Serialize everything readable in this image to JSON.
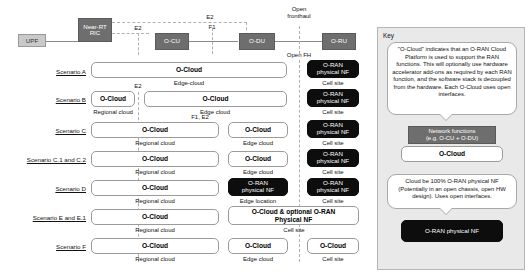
{
  "architecture": {
    "nodes": {
      "upf": "UPF",
      "near_rt_ric": "Near-RT\nRIC",
      "ocu": "O-CU",
      "odu": "O-DU",
      "dru": "O-RU"
    },
    "interfaces": {
      "e2_upper": "E2",
      "e2_lower": "E2",
      "f1": "F1",
      "open_fronthaul": "Open\nfronthaul",
      "open_fh": "Open FH"
    }
  },
  "columns": {
    "regional": "Regional cloud",
    "edge_cloud": "Edge cloud",
    "edge_cloud_hyphen": "Edge-cloud",
    "edge_location": "Edge location",
    "cell_site": "Cell site"
  },
  "common": {
    "ocloud": "O-Cloud",
    "oran_physical_nf": "O-RAN\nphysical NF",
    "ocloud_optional_nf": "O-Cloud & optional O-RAN\nPhysical NF",
    "f1_e2": "F1, E2",
    "e2": "E2"
  },
  "scenarios": [
    {
      "label": "Scenario A",
      "boxes": [
        {
          "kind": "ocloud",
          "text": "O-Cloud",
          "caption": "Edge-cloud"
        },
        {
          "kind": "blacknf",
          "text": "O-RAN\nphysical NF",
          "caption": "Cell site"
        }
      ]
    },
    {
      "label": "Scenario B",
      "boxes": [
        {
          "kind": "ocloud",
          "text": "O-Cloud",
          "caption": "Regional cloud"
        },
        {
          "kind": "ocloud",
          "text": "O-Cloud",
          "caption": "Edge cloud"
        },
        {
          "kind": "blacknf",
          "text": "O-RAN\nphysical NF",
          "caption": "Cell site"
        }
      ]
    },
    {
      "label": "Scenario C",
      "boxes": [
        {
          "kind": "ocloud",
          "text": "O-Cloud",
          "caption": "Regional cloud"
        },
        {
          "kind": "ocloud",
          "text": "O-Cloud",
          "caption": "Edge cloud"
        },
        {
          "kind": "blacknf",
          "text": "O-RAN\nphysical NF",
          "caption": "Cell site"
        }
      ]
    },
    {
      "label": "Scenario C.1 and C.2",
      "boxes": [
        {
          "kind": "ocloud",
          "text": "O-Cloud",
          "caption": "Regional cloud"
        },
        {
          "kind": "ocloud",
          "text": "O-Cloud",
          "caption": "Edge cloud"
        },
        {
          "kind": "blacknf",
          "text": "O-RAN\nphysical NF",
          "caption": "Cell site"
        }
      ]
    },
    {
      "label": "Scenario D",
      "boxes": [
        {
          "kind": "ocloud",
          "text": "O-Cloud",
          "caption": "Regional cloud"
        },
        {
          "kind": "blacknf",
          "text": "O-RAN\nphysical NF",
          "caption": "Edge location"
        },
        {
          "kind": "blacknf",
          "text": "O-RAN\nphysical NF",
          "caption": "Cell site"
        }
      ]
    },
    {
      "label": "Scenario E and E.1",
      "boxes": [
        {
          "kind": "ocloud",
          "text": "O-Cloud",
          "caption": "Regional cloud"
        },
        {
          "kind": "ocloud",
          "text": "O-Cloud & optional O-RAN\nPhysical NF",
          "caption": "Cell site"
        }
      ]
    },
    {
      "label": "Scenario F",
      "boxes": [
        {
          "kind": "ocloud",
          "text": "O-Cloud",
          "caption": "Regional cloud"
        },
        {
          "kind": "ocloud",
          "text": "O-Cloud",
          "caption": "Edge cloud"
        },
        {
          "kind": "ocloud",
          "text": "O-Cloud",
          "caption": "Cell site"
        }
      ]
    }
  ],
  "key": {
    "title": "Key",
    "bubble1": "\"O-Cloud\" indicates that an O-RAN Cloud Platform is used to support the RAN functions. This will optionally use hardware accelerator add-ons as required by each RAN function, and the software stack is decoupled from the hardware. Each O-Cloud uses open interfaces.",
    "nf_box": "Network functions\n(e.g. O-CU + O-DU)",
    "ocloud_box": "O-Cloud",
    "bubble2": "Cloud be 100% O-RAN physical NF (Potentially in an open chassis, open HW design). Uses open interfaces.",
    "black_box": "O-RAN physical NF"
  },
  "colors": {
    "nf_gray": "#6e6e6e",
    "upf_gray": "#c9c9c9",
    "black_nf": "#0d0d0d",
    "key_bg": "#e9e9e9",
    "line": "#8a8a8a",
    "dash": "#b0b0b0"
  }
}
